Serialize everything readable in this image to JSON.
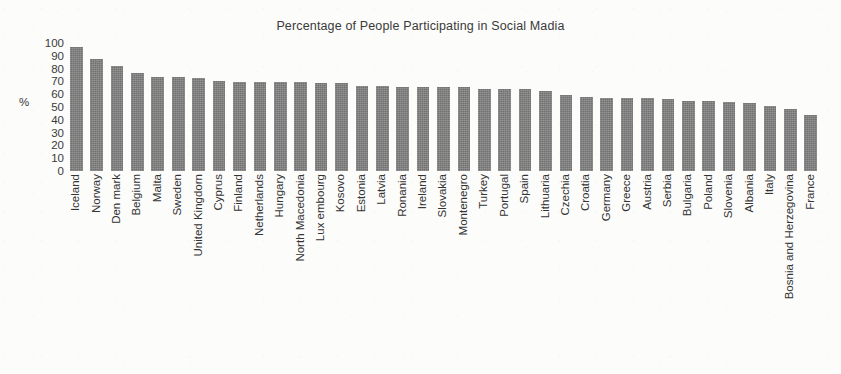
{
  "chart_data": {
    "type": "bar",
    "title": "Percentage of People Participating in Social Madia",
    "xlabel": "",
    "ylabel": "%",
    "ylim": [
      0,
      100
    ],
    "yticks": [
      100,
      90,
      80,
      70,
      60,
      50,
      40,
      30,
      20,
      10,
      0
    ],
    "grid": false,
    "legend": null,
    "bar_color": "#7f7f7f",
    "categories": [
      "Iceland",
      "Norway",
      "Den mark",
      "Belgium",
      "Malta",
      "Sweden",
      "United Kingdorn",
      "Cyprus",
      "Finland",
      "Netherlands",
      "Hungary",
      "North Macedonia",
      "Lux embourg",
      "Kosovo",
      "Estonia",
      "Latvia",
      "Ronania",
      "Ireland",
      "Slovakia",
      "Montenegro",
      "Turkey",
      "Portugal",
      "Spain",
      "Lithuaria",
      "Czechia",
      "Croatia",
      "Germany",
      "Greece",
      "Austria",
      "Serbia",
      "Bulgaria",
      "Poland",
      "Slovenia",
      "Albania",
      "Italy",
      "Bosnia and Herzegovina",
      "France"
    ],
    "values": [
      93,
      84,
      79,
      74,
      71,
      71,
      70,
      68,
      67,
      67,
      67,
      67,
      66,
      66,
      64,
      64,
      63,
      63,
      63,
      63,
      62,
      62,
      62,
      60,
      57,
      56,
      55,
      55,
      55,
      54,
      53,
      53,
      52,
      51,
      49,
      47,
      42
    ]
  }
}
